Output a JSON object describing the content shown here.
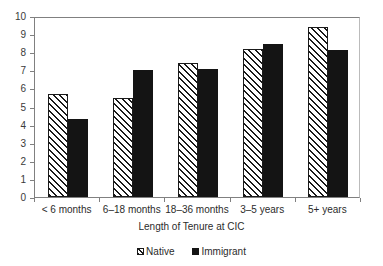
{
  "chart_data": {
    "type": "bar",
    "title": "",
    "xlabel": "Length of Tenure at CIC",
    "ylabel": "",
    "ylim": [
      0,
      10
    ],
    "ytick_labels": [
      "10",
      "9",
      "8",
      "7",
      "6",
      "5",
      "4",
      "3",
      "2",
      "1",
      "0"
    ],
    "ytick_values": [
      10,
      9,
      8,
      7,
      6,
      5,
      4,
      3,
      2,
      1,
      0
    ],
    "grid": false,
    "legend_position": "bottom-center",
    "categories": [
      "< 6 months",
      "6–18 months",
      "18–36 months",
      "3–5 years",
      "5+ years"
    ],
    "series": [
      {
        "name": "Native",
        "style": "hatched",
        "color": "#1a1a1a",
        "values": [
          5.7,
          5.45,
          7.4,
          8.2,
          9.4
        ]
      },
      {
        "name": "Immigrant",
        "style": "solid",
        "color": "#141414",
        "values": [
          4.3,
          7.0,
          7.05,
          8.45,
          8.1
        ]
      }
    ]
  },
  "legend": {
    "entries": [
      {
        "label": "Native"
      },
      {
        "label": "Immigrant"
      }
    ]
  },
  "axes": {
    "x_title": "Length of Tenure at CIC"
  }
}
